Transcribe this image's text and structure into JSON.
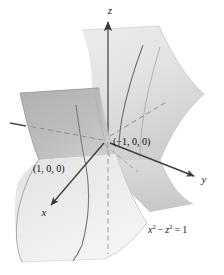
{
  "figure": {
    "kind": "3d-surface-plot",
    "background_color": "#ffffff"
  },
  "axes": {
    "x_label": "x",
    "y_label": "y",
    "z_label": "z",
    "axis_color": "#4d4d4d",
    "dashed_axis_color": "#9a9a9a"
  },
  "annotations": {
    "point_right": "(−1, 0, 0)",
    "point_left": "(1, 0, 0)",
    "equation": {
      "lhs_var1": "x",
      "sup1": "2",
      "operator": "−",
      "lhs_var2": "z",
      "sup2": "2",
      "equals": "=",
      "rhs": "1",
      "full_text": "x² − z² = 1"
    }
  },
  "surfaces": {
    "front_sheet_label": "front-hyperbolic-sheet",
    "back_sheet_label": "back-hyperbolic-sheet",
    "front_fill_top": "#b6b6b6",
    "front_fill_bottom": "#eaeaea",
    "back_fill_top": "#e6e6e6",
    "back_fill_bottom": "#d2d2d2",
    "grid_curve_color": "#8c8c8c"
  }
}
